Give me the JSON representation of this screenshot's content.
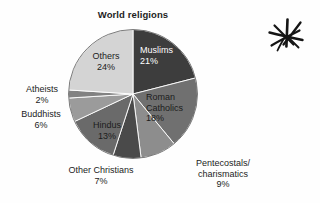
{
  "chart_data": {
    "type": "pie",
    "title": "World religions",
    "xlabel": "",
    "ylabel": "",
    "legend": "none",
    "grid": false,
    "unit": "%",
    "categories": [
      "Muslims",
      "Roman Catholics",
      "Pentecostals/charismatics",
      "Other Christians",
      "Hindus",
      "Buddhists",
      "Atheists",
      "Others"
    ],
    "values": [
      21,
      18,
      9,
      7,
      13,
      6,
      2,
      24
    ],
    "slices": [
      {
        "name": "Muslims",
        "label_lines": [
          "Muslims"
        ],
        "value": 21,
        "value_text": "21%",
        "color": "#3d3d3d",
        "text_color": "#ffffff",
        "label_placement": "inside"
      },
      {
        "name": "Roman Catholics",
        "label_lines": [
          "Roman",
          "Catholics"
        ],
        "value": 18,
        "value_text": "18%",
        "color": "#707070",
        "text_color": "#1c1c1c",
        "label_placement": "inside"
      },
      {
        "name": "Pentecostals/charismatics",
        "label_lines": [
          "Pentecostals/",
          "charismatics"
        ],
        "value": 9,
        "value_text": "9%",
        "color": "#8d8d8d",
        "text_color": "#1c1c1c",
        "label_placement": "outside"
      },
      {
        "name": "Other Christians",
        "label_lines": [
          "Other Christians"
        ],
        "value": 7,
        "value_text": "7%",
        "color": "#4a4a4a",
        "text_color": "#1c1c1c",
        "label_placement": "outside"
      },
      {
        "name": "Hindus",
        "label_lines": [
          "Hindus"
        ],
        "value": 13,
        "value_text": "13%",
        "color": "#6a6a6a",
        "text_color": "#1c1c1c",
        "label_placement": "inside"
      },
      {
        "name": "Buddhists",
        "label_lines": [
          "Buddhists"
        ],
        "value": 6,
        "value_text": "6%",
        "color": "#9b9b9b",
        "text_color": "#1c1c1c",
        "label_placement": "outside"
      },
      {
        "name": "Atheists",
        "label_lines": [
          "Atheists"
        ],
        "value": 2,
        "value_text": "2%",
        "color": "#828282",
        "text_color": "#1c1c1c",
        "label_placement": "outside"
      },
      {
        "name": "Others",
        "label_lines": [
          "Others"
        ],
        "value": 24,
        "value_text": "24%",
        "color": "#d4d4d4",
        "text_color": "#1c1c1c",
        "label_placement": "inside"
      }
    ]
  },
  "labels": {
    "muslims_name": "Muslims",
    "muslims_pct": "21%",
    "catholics_line1": "Roman",
    "catholics_line2": "Catholics",
    "catholics_pct": "18%",
    "others_name": "Others",
    "others_pct": "24%",
    "hindus_name": "Hindus",
    "hindus_pct": "13%",
    "atheists_name": "Atheists",
    "atheists_pct": "2%",
    "buddhists_name": "Buddhists",
    "buddhists_pct": "6%",
    "otherchristians_name": "Other Christians",
    "otherchristians_pct": "7%",
    "pentecostals_line1": "Pentecostals/",
    "pentecostals_line2": "charismatics",
    "pentecostals_pct": "9%"
  },
  "annotation": {
    "mark": "hand-drawn-asterisk",
    "color": "#151515"
  },
  "page": {
    "background": "#fefefe"
  }
}
